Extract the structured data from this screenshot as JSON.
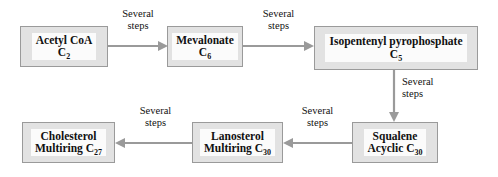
{
  "diagram": {
    "type": "flowchart",
    "colors": {
      "box_fill": "#e2e2e2",
      "box_border": "#9a9a9a",
      "box_inner_fill": "#fbfbfb",
      "arrow": "#9a9a9a",
      "text": "#111111",
      "background": "#ffffff"
    },
    "nodes": [
      {
        "id": "acetyl-coa",
        "name": "Acetyl CoA",
        "line1": "Acetyl CoA",
        "line2_prefix": "C",
        "line2_sub": "2",
        "carbon_count": 2
      },
      {
        "id": "mevalonate",
        "name": "Mevalonate",
        "line1": "Mevalonate",
        "line2_prefix": "C",
        "line2_sub": "6",
        "carbon_count": 6
      },
      {
        "id": "isopentenyl-pyrophosphate",
        "name": "Isopentenyl pyrophosphate",
        "line1": "Isopentenyl pyrophosphate",
        "line2_prefix": "C",
        "line2_sub": "5",
        "carbon_count": 5
      },
      {
        "id": "squalene",
        "name": "Squalene",
        "line1": "Squalene",
        "line2_prefix": "Acyclic C",
        "line2_sub": "30",
        "carbon_count": 30
      },
      {
        "id": "lanosterol",
        "name": "Lanosterol",
        "line1": "Lanosterol",
        "line2_prefix": "Multiring C",
        "line2_sub": "30",
        "carbon_count": 30
      },
      {
        "id": "cholesterol",
        "name": "Cholesterol",
        "line1": "Cholesterol",
        "line2_prefix": "Multiring C",
        "line2_sub": "27",
        "carbon_count": 27
      }
    ],
    "edges": [
      {
        "id": "acetyl-to-mevalonate",
        "from": "acetyl-coa",
        "to": "mevalonate",
        "direction": "right",
        "label_line1": "Several",
        "label_line2": "steps"
      },
      {
        "id": "mevalonate-to-ipp",
        "from": "mevalonate",
        "to": "isopentenyl-pyrophosphate",
        "direction": "right",
        "label_line1": "Several",
        "label_line2": "steps"
      },
      {
        "id": "ipp-to-squalene",
        "from": "isopentenyl-pyrophosphate",
        "to": "squalene",
        "direction": "down",
        "label_line1": "Several",
        "label_line2": "steps"
      },
      {
        "id": "squalene-to-lanosterol",
        "from": "squalene",
        "to": "lanosterol",
        "direction": "left",
        "label_line1": "Several",
        "label_line2": "steps"
      },
      {
        "id": "lanosterol-to-cholesterol",
        "from": "lanosterol",
        "to": "cholesterol",
        "direction": "left",
        "label_line1": "Several",
        "label_line2": "steps"
      }
    ]
  }
}
